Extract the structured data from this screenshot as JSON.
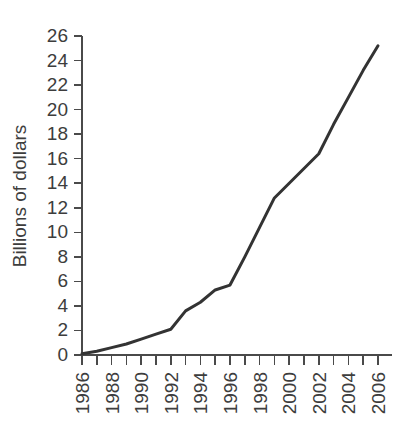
{
  "chart_data": {
    "type": "line",
    "title": "",
    "subtitle": "",
    "xlabel": "",
    "ylabel": "Billions of dollars",
    "xlim": [
      1986,
      2006
    ],
    "ylim": [
      0,
      26
    ],
    "grid": false,
    "legend": false,
    "legend_position": "none",
    "line_color": "#333333",
    "line_width": 3,
    "y_ticks": [
      0,
      2,
      4,
      6,
      8,
      10,
      12,
      14,
      16,
      18,
      20,
      22,
      24,
      26
    ],
    "y_tick_labels": [
      "0",
      "2",
      "4",
      "6",
      "8",
      "10",
      "12",
      "14",
      "16",
      "18",
      "20",
      "22",
      "24",
      "26"
    ],
    "x_ticks": [
      1986,
      1987,
      1988,
      1989,
      1990,
      1991,
      1992,
      1993,
      1994,
      1995,
      1996,
      1997,
      1998,
      1999,
      2000,
      2001,
      2002,
      2003,
      2004,
      2005,
      2006
    ],
    "x_tick_labels_shown": [
      "1986",
      "1988",
      "1990",
      "1992",
      "1994",
      "1996",
      "1998",
      "2000",
      "2002",
      "2004",
      "2006"
    ],
    "x_tick_label_rotation": -90,
    "y_axis_label_rotation": -90,
    "x": [
      1986,
      1987,
      1988,
      1989,
      1990,
      1991,
      1992,
      1993,
      1994,
      1995,
      1996,
      1997,
      1998,
      1999,
      2000,
      2001,
      2002,
      2003,
      2004,
      2005,
      2006
    ],
    "values": [
      0.1,
      0.3,
      0.6,
      0.9,
      1.3,
      1.7,
      2.1,
      3.6,
      4.3,
      5.3,
      5.7,
      8.0,
      10.4,
      12.8,
      14.0,
      15.2,
      16.4,
      18.8,
      21.0,
      23.2,
      25.2
    ],
    "annotations": []
  },
  "figure": {
    "background_color": "#ffffff",
    "axis_color": "#4a4a4a",
    "text_color": "#3d3d3d"
  }
}
